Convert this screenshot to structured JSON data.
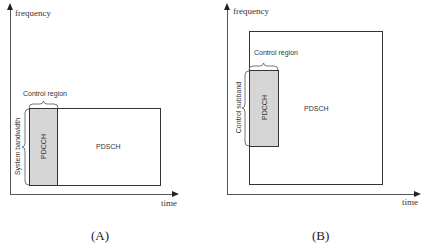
{
  "diagrams": [
    {
      "id": "A",
      "caption": "(A)",
      "y_axis_label": "frequency",
      "x_axis_label": "time",
      "control_region_label": "Control region",
      "side_bracket_label": "System bandwidth",
      "pdcch_label": "PDCCH",
      "pdsch_label": "PDSCH"
    },
    {
      "id": "B",
      "caption": "(B)",
      "y_axis_label": "frequency",
      "x_axis_label": "time",
      "control_region_label": "Control region",
      "side_bracket_label": "Control subband",
      "pdcch_label": "PDCCH",
      "pdsch_label": "PDSCH"
    }
  ],
  "colors": {
    "pdcch_fill": "#d6d6d6",
    "line": "#333333",
    "background": "#ffffff"
  }
}
